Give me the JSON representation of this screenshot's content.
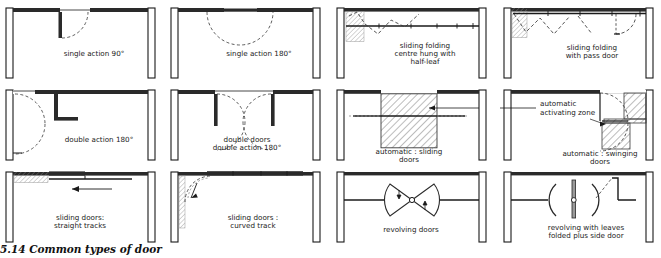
{
  "figure": {
    "caption_number": "5.14",
    "caption_text": "Common types of door",
    "ink": "#1a1a1a",
    "hatch": "#5a5a5a",
    "dash": "#444444"
  },
  "panels": [
    {
      "id": "single-action-90",
      "label": [
        "single   action 90°"
      ]
    },
    {
      "id": "single-action-180",
      "label": [
        "single  action 180°"
      ]
    },
    {
      "id": "sliding-folding-centre-hung",
      "label": [
        "sliding  folding",
        "centre hung with",
        "half-leaf"
      ]
    },
    {
      "id": "sliding-folding-pass-door",
      "label": [
        "sliding  folding",
        "with  pass  door"
      ]
    },
    {
      "id": "double-action-180",
      "label": [
        "double  action 180°"
      ]
    },
    {
      "id": "double-doors-double-action-180",
      "label": [
        "double   doors",
        "double  action 180°"
      ]
    },
    {
      "id": "automatic-sliding-doors",
      "label": [
        "automatic : sliding",
        "doors"
      ]
    },
    {
      "id": "automatic-swinging-doors",
      "label": [
        "automatic : swinging",
        "doors"
      ]
    },
    {
      "id": "sliding-doors-straight-tracks",
      "label": [
        "sliding   doors:",
        "straight  tracks"
      ]
    },
    {
      "id": "sliding-doors-curved-track",
      "label": [
        "sliding   doors :",
        "curved   track"
      ]
    },
    {
      "id": "revolving-doors",
      "label": [
        "revolving  doors"
      ]
    },
    {
      "id": "revolving-leaves-folded",
      "label": [
        "revolving  with  leaves",
        "folded  plus  side door"
      ]
    }
  ],
  "annotation": {
    "activating_zone": [
      "automatic",
      "activating zone"
    ]
  }
}
